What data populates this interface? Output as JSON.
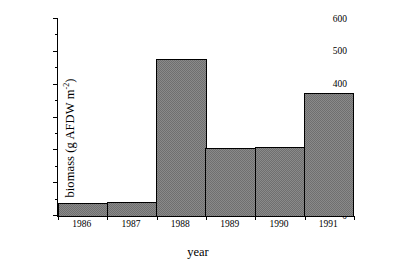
{
  "chart_data": {
    "type": "bar",
    "title": "",
    "subtitle": "",
    "xlabel": "year",
    "ylabel": "biomass (g AFDW m-2)",
    "ylabel_parts": {
      "main": "biomass (g AFDW m",
      "exponent": "-2",
      "tail": ")"
    },
    "categories": [
      "1986",
      "1987",
      "1988",
      "1989",
      "1990",
      "1991"
    ],
    "values": [
      40,
      42,
      478,
      208,
      211,
      375
    ],
    "ylim": [
      0,
      600
    ],
    "yticks": [
      0,
      100,
      200,
      300,
      400,
      500,
      600
    ],
    "ytick_labels": [
      "0",
      "100",
      "200",
      "300",
      "400",
      "500",
      "600"
    ],
    "yminorticks": [
      50,
      150,
      250,
      350,
      450,
      550
    ],
    "grid": false,
    "legend": null,
    "bar_fill": "#8a8a8a",
    "bar_fill_pattern": "checkerboard-dither",
    "bar_edge_color": "#000000",
    "axis_color": "#000000",
    "background": "#ffffff",
    "axes_spines": [
      "left",
      "bottom"
    ],
    "annotations": []
  }
}
